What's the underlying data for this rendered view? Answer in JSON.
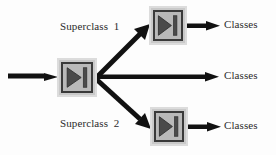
{
  "diagram": {
    "colors": {
      "node_fill": "#b9b9b9",
      "node_outer": "#dcdcdc",
      "node_border": "#3a3a3a",
      "glyph": "#3a3a3a",
      "edge": "#111111",
      "text": "#2b2b2b",
      "background": "#fdfdfd"
    },
    "nodes": [
      {
        "id": "root-classifier",
        "icon": "classifier-play-bar-icon",
        "x": 57,
        "y": 58,
        "w": 40,
        "h": 39
      },
      {
        "id": "superclass1-classifier",
        "icon": "classifier-play-bar-icon",
        "x": 149,
        "y": 6,
        "w": 38,
        "h": 39
      },
      {
        "id": "superclass2-classifier",
        "icon": "classifier-play-bar-icon",
        "x": 150,
        "y": 107,
        "w": 38,
        "h": 39
      }
    ],
    "edges": [
      {
        "id": "input-edge",
        "kind": "horizontal-arrow",
        "from": "input",
        "to": "root-classifier"
      },
      {
        "id": "root-to-superclass1-edge",
        "kind": "diagonal-arrow-up",
        "from": "root-classifier",
        "to": "superclass1-classifier"
      },
      {
        "id": "root-to-classes-middle-edge",
        "kind": "horizontal-arrow",
        "from": "root-classifier",
        "to": "classes-middle"
      },
      {
        "id": "root-to-superclass2-edge",
        "kind": "diagonal-arrow-down",
        "from": "root-classifier",
        "to": "superclass2-classifier"
      },
      {
        "id": "superclass1-to-classes-edge",
        "kind": "horizontal-arrow",
        "from": "superclass1-classifier",
        "to": "classes-top"
      },
      {
        "id": "superclass2-to-classes-edge",
        "kind": "horizontal-arrow",
        "from": "superclass2-classifier",
        "to": "classes-bottom"
      }
    ],
    "labels": {
      "superclass_1": "Superclass  1",
      "superclass_2": "Superclass  2",
      "classes_top": "Classes",
      "classes_middle": "Classes",
      "classes_bottom": "Classes"
    }
  }
}
